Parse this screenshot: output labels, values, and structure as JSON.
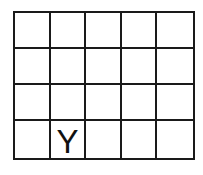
{
  "grid": {
    "rows": 4,
    "cols": 5,
    "cells": [
      [
        "",
        "",
        "",
        "",
        ""
      ],
      [
        "",
        "",
        "",
        "",
        ""
      ],
      [
        "",
        "",
        "",
        "",
        ""
      ],
      [
        "",
        "Y",
        "",
        "",
        ""
      ]
    ]
  }
}
